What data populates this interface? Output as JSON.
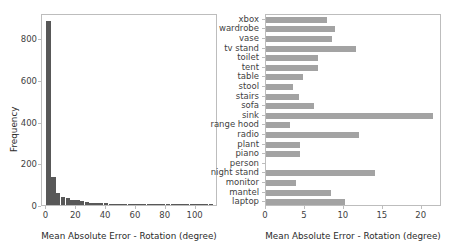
{
  "figure": {
    "width": 455,
    "height": 248,
    "background": "#ffffff",
    "panels": [
      "histogram",
      "horizontal-bar"
    ]
  },
  "colors": {
    "hist_bar": "#585858",
    "barh_bar": "#a3a3a3",
    "frame": "#bdbdbd",
    "tick_text": "#3f3f3f",
    "axis_title": "#2b2b2b"
  },
  "chart_data": [
    {
      "type": "bar",
      "id": "histogram",
      "title": "",
      "xlabel": "Mean Absolute Error - Rotation (degree)",
      "ylabel": "Frequency",
      "xlim": [
        -3,
        115
      ],
      "ylim": [
        0,
        920
      ],
      "xticks": [
        0,
        20,
        40,
        60,
        80,
        100
      ],
      "xtick_labels": [
        "0",
        "20",
        "40",
        "60",
        "80",
        "100"
      ],
      "yticks": [
        0,
        200,
        400,
        600,
        800
      ],
      "ytick_labels": [
        "0",
        "200",
        "400",
        "600",
        "800"
      ],
      "grid": false,
      "legend": "none",
      "bin_width": 3.2,
      "bin_edges": [
        0,
        3.2,
        6.4,
        9.6,
        12.8,
        16.0,
        19.2,
        22.4,
        25.6,
        28.8,
        32.0,
        35.2,
        38.4,
        41.6,
        44.8,
        48.0,
        51.2,
        54.4,
        57.6,
        60.8,
        64.0,
        67.2,
        70.4,
        73.6,
        76.8,
        80.0,
        83.2,
        86.4,
        89.6,
        92.8,
        96.0,
        99.2,
        102.4,
        105.6,
        108.8,
        112.0
      ],
      "values": [
        880,
        135,
        56,
        40,
        36,
        25,
        22,
        18,
        14,
        12,
        11,
        9,
        8,
        7,
        6,
        5,
        4,
        4,
        3,
        5,
        3,
        2,
        2,
        3,
        2,
        2,
        1,
        1,
        1,
        1,
        2,
        1,
        1,
        1,
        1
      ]
    },
    {
      "type": "bar",
      "id": "horizontal-bar",
      "orientation": "horizontal",
      "title": "",
      "xlabel": "Mean Absolute Error - Rotation (degree)",
      "ylabel": "",
      "xlim": [
        0,
        22.6
      ],
      "xticks": [
        0,
        5,
        10,
        15,
        20
      ],
      "xtick_labels": [
        "0",
        "5",
        "10",
        "15",
        "20"
      ],
      "grid": false,
      "legend": "none",
      "categories": [
        "xbox",
        "wardrobe",
        "vase",
        "tv stand",
        "toilet",
        "tent",
        "table",
        "stool",
        "stairs",
        "sofa",
        "sink",
        "range hood",
        "radio",
        "plant",
        "piano",
        "person",
        "night stand",
        "monitor",
        "mantel",
        "laptop"
      ],
      "values": [
        7.8,
        8.9,
        8.5,
        11.5,
        6.7,
        6.7,
        4.8,
        3.5,
        4.3,
        6.1,
        21.5,
        3.1,
        11.9,
        4.4,
        4.4,
        0.0,
        14.0,
        3.8,
        8.3,
        10.1
      ]
    }
  ]
}
